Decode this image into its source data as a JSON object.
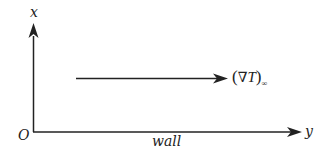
{
  "diagram": {
    "axes": {
      "vertical_label": "x",
      "horizontal_label": "y",
      "origin_label": "O",
      "wall_label": "wall"
    },
    "gradient_arrow": {
      "open_paren": "(",
      "nabla": "∇",
      "variable": "T",
      "close_paren": ")",
      "subscript": "∞"
    },
    "colors": {
      "line": "#222222",
      "background": "#ffffff"
    }
  }
}
